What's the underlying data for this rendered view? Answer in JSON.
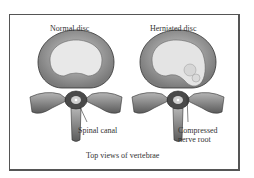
{
  "figure": {
    "panels": [
      {
        "title": "Normal disc",
        "callout": "Spinal canal"
      },
      {
        "title": "Herniated disc",
        "callout_line1": "Compressed",
        "callout_line2": "nerve root"
      }
    ],
    "caption": "Top views of vertebrae"
  },
  "colors": {
    "frame": "#555555",
    "bone": "#8a8a8a",
    "bone_dark": "#3a3a3a",
    "disc_ring": "#9a9a9a",
    "nucleus": "#e6e6e6"
  }
}
